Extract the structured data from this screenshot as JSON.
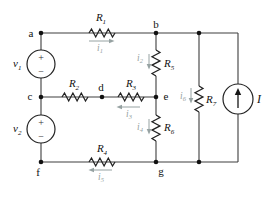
{
  "figure": {
    "colors": {
      "bg": "#ffffff",
      "wire": "#3f3f3f",
      "component": "#222222",
      "label": "#111111",
      "current": "#96a2a2"
    },
    "resistors": [
      {
        "base": "R",
        "sub": "1"
      },
      {
        "base": "R",
        "sub": "2"
      },
      {
        "base": "R",
        "sub": "3"
      },
      {
        "base": "R",
        "sub": "4"
      },
      {
        "base": "R",
        "sub": "5"
      },
      {
        "base": "R",
        "sub": "6"
      },
      {
        "base": "R",
        "sub": "7"
      }
    ],
    "voltage_sources": [
      {
        "base": "v",
        "sub": "1",
        "plus": "+",
        "minus": "−"
      },
      {
        "base": "v",
        "sub": "2",
        "plus": "+",
        "minus": "−"
      }
    ],
    "current_source": {
      "label": "I"
    },
    "branch_currents": [
      {
        "base": "i",
        "sub": "1"
      },
      {
        "base": "i",
        "sub": "2"
      },
      {
        "base": "i",
        "sub": "3"
      },
      {
        "base": "i",
        "sub": "4"
      },
      {
        "base": "i",
        "sub": "5"
      },
      {
        "base": "i",
        "sub": "6"
      }
    ],
    "nodes": [
      "a",
      "b",
      "c",
      "d",
      "e",
      "f",
      "g"
    ]
  }
}
